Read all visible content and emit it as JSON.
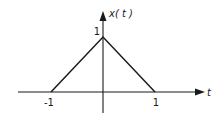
{
  "chart_data": {
    "type": "line",
    "title": "",
    "xlabel": "t",
    "ylabel": "x(t)",
    "xlim": [
      -1.9,
      1.9
    ],
    "ylim": [
      -0.4,
      1.6
    ],
    "grid": false,
    "legend": "none",
    "series": [
      {
        "name": "x(t)",
        "x": [
          -1,
          0,
          1
        ],
        "y": [
          0,
          1,
          0
        ]
      }
    ],
    "x_ticks": [
      {
        "value": -1,
        "label": "-1"
      },
      {
        "value": 1,
        "label": "1"
      }
    ],
    "y_ticks": [
      {
        "value": 1,
        "label": "1"
      }
    ],
    "colors": {
      "line": "#1a1a1a",
      "axis": "#1a1a1a"
    }
  }
}
